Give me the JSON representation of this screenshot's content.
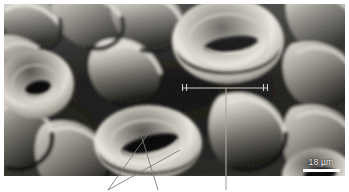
{
  "figure": {
    "kind": "sem-micrograph",
    "background_color": "#ffffff",
    "plate": {
      "x": 4,
      "y": 4,
      "width": 341,
      "height": 172,
      "tone_dark": "#121212",
      "tone_mid": "#6e6e6e",
      "tone_light": "#e8e6e0"
    }
  },
  "scale_bar": {
    "label": "18 µm",
    "value": 18,
    "unit": "µm",
    "bar_color": "#ffffff",
    "text_color": "#ffffff",
    "bar_length_px": 37,
    "position": "bottom-right"
  },
  "annotations": {
    "bracket": {
      "name": "epidermal-cell-width-bracket",
      "x1": 182,
      "x2": 268,
      "y": 88,
      "tick_drop": 6,
      "color": "#c8c6c0"
    },
    "leaders": [
      {
        "name": "leader-guard-cell-left",
        "x1": 108,
        "y1": 190,
        "x2": 148,
        "y2": 133,
        "color": "#6a6a6a"
      },
      {
        "name": "leader-guard-cell-right",
        "x1": 108,
        "y1": 190,
        "x2": 176,
        "y2": 148,
        "color": "#6a6a6a"
      },
      {
        "name": "leader-stomatal-pore",
        "x1": 158,
        "y1": 190,
        "x2": 142,
        "y2": 140,
        "color": "#6a6a6a"
      },
      {
        "name": "leader-bracket-callout",
        "x1": 226,
        "y1": 88,
        "x2": 226,
        "y2": 190,
        "color": "#9a9892"
      }
    ]
  },
  "stomata": [
    {
      "name": "stoma-top-right",
      "cx": 228,
      "cy": 41,
      "guard_rx": 54,
      "guard_ry": 41,
      "pore_rx": 26,
      "pore_ry": 7,
      "pore_rotate": -8,
      "aperture": "open"
    },
    {
      "name": "stoma-left",
      "cx": 36,
      "cy": 84,
      "guard_rx": 36,
      "guard_ry": 33,
      "pore_rx": 12,
      "pore_ry": 6,
      "pore_rotate": -12,
      "aperture": "open"
    },
    {
      "name": "stoma-bottom-center",
      "cx": 148,
      "cy": 143,
      "guard_rx": 52,
      "guard_ry": 36,
      "pore_rx": 28,
      "pore_ry": 8,
      "pore_rotate": -14,
      "aperture": "open"
    },
    {
      "name": "stoma-bottom-right-partial",
      "cx": 318,
      "cy": 176,
      "guard_rx": 34,
      "guard_ry": 26,
      "pore_rx": 15,
      "pore_ry": 6,
      "pore_rotate": -6,
      "aperture": "open"
    }
  ]
}
